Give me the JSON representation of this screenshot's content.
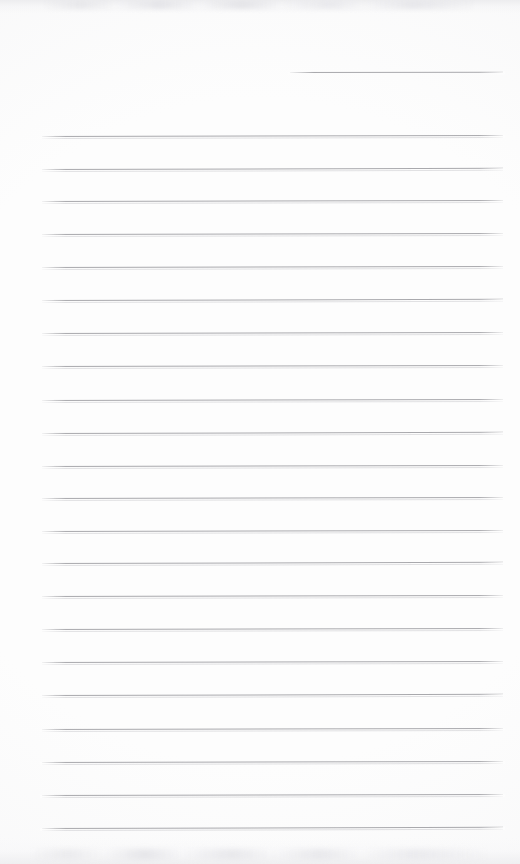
{
  "document": {
    "kind": "blank-ruled-note-page",
    "title": "",
    "body_text": "",
    "background_color": "#fdfdfd",
    "rule_color": "#a9a9ad",
    "page_width": 520,
    "page_height": 864
  },
  "header": {
    "date_line": {
      "label": "",
      "value": "",
      "placeholder": "",
      "x": 290,
      "y": 72,
      "width": 213
    }
  },
  "ruled_area": {
    "left_margin": 42,
    "right_edge": 503,
    "line_width": 461,
    "first_line_y": 136,
    "line_spacing": 32.7,
    "line_count": 22,
    "lines": [
      {
        "index": 1,
        "y": 136,
        "value": "",
        "tilt_deg": -0.12
      },
      {
        "index": 2,
        "y": 169,
        "value": "",
        "tilt_deg": -0.14
      },
      {
        "index": 3,
        "y": 201,
        "value": "",
        "tilt_deg": -0.11
      },
      {
        "index": 4,
        "y": 234,
        "value": "",
        "tilt_deg": -0.13
      },
      {
        "index": 5,
        "y": 267,
        "value": "",
        "tilt_deg": -0.12
      },
      {
        "index": 6,
        "y": 300,
        "value": "",
        "tilt_deg": -0.14
      },
      {
        "index": 7,
        "y": 333,
        "value": "",
        "tilt_deg": -0.12
      },
      {
        "index": 8,
        "y": 366,
        "value": "",
        "tilt_deg": -0.13
      },
      {
        "index": 9,
        "y": 400,
        "value": "",
        "tilt_deg": -0.12
      },
      {
        "index": 10,
        "y": 433,
        "value": "",
        "tilt_deg": -0.14
      },
      {
        "index": 11,
        "y": 466,
        "value": "",
        "tilt_deg": -0.12
      },
      {
        "index": 12,
        "y": 498,
        "value": "",
        "tilt_deg": -0.13
      },
      {
        "index": 13,
        "y": 531,
        "value": "",
        "tilt_deg": -0.12
      },
      {
        "index": 14,
        "y": 563,
        "value": "",
        "tilt_deg": -0.14
      },
      {
        "index": 15,
        "y": 596,
        "value": "",
        "tilt_deg": -0.12
      },
      {
        "index": 16,
        "y": 629,
        "value": "",
        "tilt_deg": -0.13
      },
      {
        "index": 17,
        "y": 662,
        "value": "",
        "tilt_deg": -0.12
      },
      {
        "index": 18,
        "y": 695,
        "value": "",
        "tilt_deg": -0.14
      },
      {
        "index": 19,
        "y": 729,
        "value": "",
        "tilt_deg": -0.12
      },
      {
        "index": 20,
        "y": 762,
        "value": "",
        "tilt_deg": -0.13
      },
      {
        "index": 21,
        "y": 795,
        "value": "",
        "tilt_deg": -0.12
      },
      {
        "index": 22,
        "y": 828,
        "value": "",
        "tilt_deg": -0.14
      }
    ]
  },
  "scan_artifacts": {
    "top_band": {
      "y": 0,
      "height": 14,
      "color": "#ececee"
    },
    "bottom_band": {
      "y": 838,
      "height": 26,
      "color": "#eeeef0"
    }
  }
}
